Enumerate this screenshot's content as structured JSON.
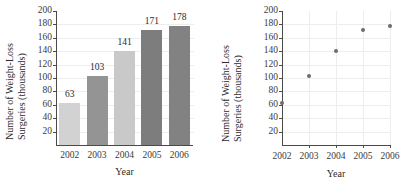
{
  "chart_data": [
    {
      "type": "bar",
      "title": "",
      "xlabel": "Year",
      "ylabel": "Number of Weight-Loss Surgeries (thousands)",
      "ylabel_line1": "Number of Weight-Loss",
      "ylabel_line2": "Surgeries (thousands)",
      "categories": [
        "2002",
        "2003",
        "2004",
        "2005",
        "2006"
      ],
      "values": [
        63,
        103,
        141,
        171,
        178
      ],
      "value_labels": [
        "63",
        "103",
        "141",
        "171",
        "178"
      ],
      "bar_colors": [
        "#d2d2d2",
        "#949494",
        "#c9c9c9",
        "#7d7d7d",
        "#828282"
      ],
      "yticks": [
        20,
        40,
        60,
        80,
        100,
        120,
        140,
        160,
        180,
        200
      ],
      "ytick_labels": [
        "20",
        "40",
        "60",
        "80",
        "100",
        "120",
        "140",
        "160",
        "180",
        "200"
      ],
      "ylim": [
        0,
        200
      ],
      "grid": "horizontal",
      "legend": "none"
    },
    {
      "type": "scatter",
      "title": "",
      "xlabel": "Year",
      "ylabel": "Number of Weight-Loss Surgeries (thousands)",
      "ylabel_line1": "Number of Weight-Loss",
      "ylabel_line2": "Surgeries (thousands)",
      "x": [
        "2002",
        "2003",
        "2004",
        "2005",
        "2006"
      ],
      "values": [
        63,
        103,
        141,
        171,
        178
      ],
      "marker_color": "#6b6b72",
      "yticks": [
        20,
        40,
        60,
        80,
        100,
        120,
        140,
        160,
        180,
        200
      ],
      "ytick_labels": [
        "20",
        "40",
        "60",
        "80",
        "100",
        "120",
        "140",
        "160",
        "180",
        "200"
      ],
      "xtick_labels": [
        "2002",
        "2003",
        "2004",
        "2005",
        "2006"
      ],
      "ylim": [
        0,
        200
      ],
      "grid": "both",
      "legend": "none"
    }
  ]
}
